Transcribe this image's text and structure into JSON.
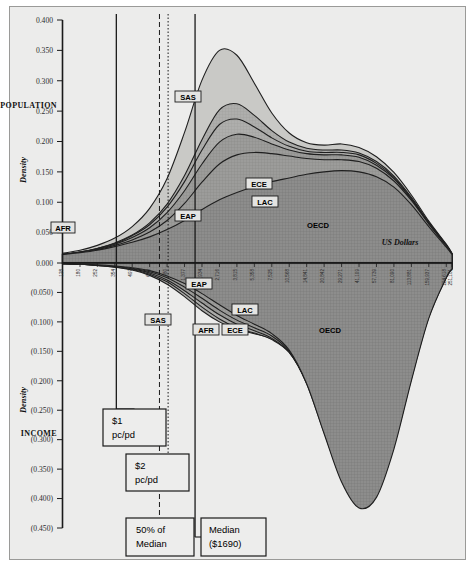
{
  "figure": {
    "background_color": "#ececeb",
    "axis_color": "#1a1a1a"
  },
  "axes": {
    "y_label": "Density",
    "x_label": "US Dollars",
    "upper_section_label": "POPULATION",
    "lower_section_label": "INCOME",
    "y_ticks": [
      "0.400",
      "0.350",
      "0.300",
      "0.250",
      "0.200",
      "0.150",
      "0.100",
      "0.050",
      "0.000",
      "(0.050)",
      "(0.100)",
      "(0.150)",
      "(0.200)",
      "(0.250)",
      "(0.300)",
      "(0.350)",
      "(0.400)",
      "(0.450)"
    ],
    "y_tick_values": [
      0.4,
      0.35,
      0.3,
      0.25,
      0.2,
      0.15,
      0.1,
      0.05,
      0.0,
      -0.05,
      -0.1,
      -0.15,
      -0.2,
      -0.25,
      -0.3,
      -0.35,
      -0.4,
      -0.45
    ],
    "y_range": [
      -0.45,
      0.4
    ],
    "x_ticks": [
      "128",
      "180",
      "252",
      "354",
      "497",
      "698",
      "980",
      "1,377",
      "1,934",
      "2,716",
      "3,815",
      "5,358",
      "7,525",
      "10,568",
      "14,841",
      "20,842",
      "29,271",
      "41,109",
      "57,739",
      "81,090",
      "113,881",
      "159,937",
      "224,618",
      "251,181"
    ],
    "x_scale": "log"
  },
  "reference_lines": [
    {
      "name": "one-dollar-pc-pd",
      "style": "solid",
      "label_line1": "$1",
      "label_line2": "pc/pd"
    },
    {
      "name": "two-dollar-pc-pd",
      "style": "dotted",
      "label_line1": "$2",
      "label_line2": "pc/pd"
    },
    {
      "name": "fifty-percent-median",
      "style": "dashed",
      "label_line1": "50% of",
      "label_line2": "Median"
    },
    {
      "name": "median",
      "style": "solid",
      "label_line1": "Median",
      "label_line2": "($1690)"
    }
  ],
  "annotations": [
    {
      "line1": "$1",
      "line2": "pc/pd"
    },
    {
      "line1": "$2",
      "line2": "pc/pd"
    },
    {
      "line1": "50% of",
      "line2": "Median"
    },
    {
      "line1": "Median",
      "line2": "($1690)"
    }
  ],
  "region_labels_population": [
    "AFR",
    "SAS",
    "EAP",
    "ECE",
    "LAC",
    "OECD"
  ],
  "region_labels_income": [
    "EAP",
    "SAS",
    "AFR",
    "ECE",
    "LAC",
    "OECD"
  ],
  "chart_data": {
    "type": "area",
    "title": "",
    "subtitle": "",
    "xlabel": "US Dollars",
    "ylabel": "Density",
    "xscale": "log",
    "xlim": [
      128,
      251181
    ],
    "ylim": [
      -0.45,
      0.4
    ],
    "grid": false,
    "legend_position": "inline-labels",
    "mirrored": true,
    "upper_panel_name": "POPULATION",
    "lower_panel_name": "INCOME",
    "x": [
      128,
      180,
      252,
      354,
      497,
      698,
      980,
      1377,
      1934,
      2716,
      3815,
      5358,
      7525,
      10568,
      14841,
      20842,
      29271,
      41109,
      57739,
      81090,
      113881,
      159937,
      224618,
      251181
    ],
    "series": [
      {
        "name": "AFR",
        "panel": "population",
        "stack_order": 1,
        "values": [
          0.014,
          0.017,
          0.021,
          0.027,
          0.034,
          0.043,
          0.055,
          0.07,
          0.088,
          0.104,
          0.116,
          0.126,
          0.134,
          0.14,
          0.146,
          0.15,
          0.152,
          0.15,
          0.142,
          0.125,
          0.096,
          0.06,
          0.026,
          0.014
        ]
      },
      {
        "name": "EAP",
        "panel": "population",
        "stack_order": 2,
        "values": [
          0.014,
          0.017,
          0.022,
          0.029,
          0.038,
          0.051,
          0.07,
          0.098,
          0.133,
          0.163,
          0.178,
          0.182,
          0.18,
          0.176,
          0.172,
          0.17,
          0.17,
          0.167,
          0.156,
          0.135,
          0.103,
          0.064,
          0.028,
          0.015
        ]
      },
      {
        "name": "SAS",
        "panel": "population",
        "stack_order": 3,
        "values": [
          0.014,
          0.018,
          0.023,
          0.031,
          0.042,
          0.058,
          0.083,
          0.119,
          0.163,
          0.199,
          0.212,
          0.207,
          0.196,
          0.186,
          0.18,
          0.178,
          0.178,
          0.174,
          0.161,
          0.139,
          0.105,
          0.065,
          0.029,
          0.015
        ]
      },
      {
        "name": "ECE",
        "panel": "population",
        "stack_order": 4,
        "values": [
          0.014,
          0.018,
          0.024,
          0.032,
          0.045,
          0.063,
          0.092,
          0.134,
          0.186,
          0.228,
          0.237,
          0.224,
          0.206,
          0.192,
          0.184,
          0.182,
          0.182,
          0.178,
          0.164,
          0.141,
          0.106,
          0.066,
          0.029,
          0.015
        ]
      },
      {
        "name": "LAC",
        "panel": "population",
        "stack_order": 5,
        "values": [
          0.014,
          0.018,
          0.024,
          0.033,
          0.046,
          0.066,
          0.097,
          0.144,
          0.203,
          0.252,
          0.262,
          0.243,
          0.218,
          0.199,
          0.189,
          0.186,
          0.186,
          0.181,
          0.167,
          0.143,
          0.108,
          0.067,
          0.03,
          0.015
        ]
      },
      {
        "name": "OECD",
        "panel": "population",
        "stack_order": 6,
        "values": [
          0.016,
          0.021,
          0.029,
          0.041,
          0.06,
          0.09,
          0.139,
          0.215,
          0.301,
          0.35,
          0.342,
          0.296,
          0.247,
          0.214,
          0.198,
          0.194,
          0.196,
          0.19,
          0.175,
          0.149,
          0.112,
          0.069,
          0.031,
          0.016
        ]
      },
      {
        "name": "EAP",
        "panel": "income",
        "stack_order": 1,
        "values": [
          -0.001,
          -0.002,
          -0.003,
          -0.005,
          -0.008,
          -0.013,
          -0.022,
          -0.035,
          -0.052,
          -0.071,
          -0.089,
          -0.104,
          -0.12,
          -0.148,
          -0.205,
          -0.29,
          -0.372,
          -0.416,
          -0.398,
          -0.316,
          -0.2,
          -0.094,
          -0.025,
          -0.01
        ]
      },
      {
        "name": "SAS",
        "panel": "income",
        "stack_order": 2,
        "values": [
          -0.001,
          -0.002,
          -0.003,
          -0.005,
          -0.009,
          -0.015,
          -0.025,
          -0.041,
          -0.06,
          -0.08,
          -0.097,
          -0.11,
          -0.124,
          -0.15,
          -0.205,
          -0.288,
          -0.368,
          -0.41,
          -0.392,
          -0.311,
          -0.197,
          -0.092,
          -0.025,
          -0.01
        ]
      },
      {
        "name": "AFR",
        "panel": "income",
        "stack_order": 3,
        "values": [
          -0.001,
          -0.002,
          -0.004,
          -0.006,
          -0.01,
          -0.017,
          -0.029,
          -0.047,
          -0.068,
          -0.088,
          -0.104,
          -0.115,
          -0.128,
          -0.152,
          -0.204,
          -0.283,
          -0.36,
          -0.4,
          -0.383,
          -0.304,
          -0.193,
          -0.09,
          -0.024,
          -0.01
        ]
      },
      {
        "name": "ECE",
        "panel": "income",
        "stack_order": 4,
        "values": [
          -0.001,
          -0.002,
          -0.004,
          -0.007,
          -0.011,
          -0.019,
          -0.032,
          -0.052,
          -0.075,
          -0.095,
          -0.11,
          -0.119,
          -0.13,
          -0.152,
          -0.2,
          -0.275,
          -0.348,
          -0.386,
          -0.37,
          -0.294,
          -0.187,
          -0.087,
          -0.024,
          -0.01
        ]
      },
      {
        "name": "LAC",
        "panel": "income",
        "stack_order": 5,
        "values": [
          -0.001,
          -0.002,
          -0.004,
          -0.007,
          -0.012,
          -0.021,
          -0.036,
          -0.057,
          -0.081,
          -0.1,
          -0.113,
          -0.12,
          -0.129,
          -0.148,
          -0.192,
          -0.262,
          -0.331,
          -0.367,
          -0.352,
          -0.28,
          -0.178,
          -0.083,
          -0.023,
          -0.009
        ]
      },
      {
        "name": "OECD",
        "panel": "income",
        "stack_order": 6,
        "values": [
          -0.001,
          -0.002,
          -0.003,
          -0.006,
          -0.01,
          -0.018,
          -0.031,
          -0.05,
          -0.072,
          -0.088,
          -0.098,
          -0.102,
          -0.107,
          -0.122,
          -0.16,
          -0.222,
          -0.285,
          -0.32,
          -0.308,
          -0.245,
          -0.156,
          -0.072,
          -0.02,
          -0.008
        ]
      }
    ]
  }
}
